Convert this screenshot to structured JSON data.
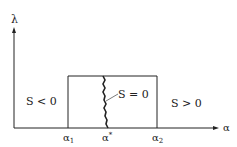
{
  "axes": {
    "y_label": "λ",
    "x_label": "α"
  },
  "regions": {
    "left": "S < 0",
    "right": "S > 0",
    "boundary": "S = 0"
  },
  "ticks": {
    "alpha1": "α",
    "alpha1_sub": "1",
    "alpha_star": "α",
    "alpha_star_sup": "*",
    "alpha2": "α",
    "alpha2_sub": "2"
  },
  "colors": {
    "line": "#222222",
    "background": "#ffffff"
  }
}
